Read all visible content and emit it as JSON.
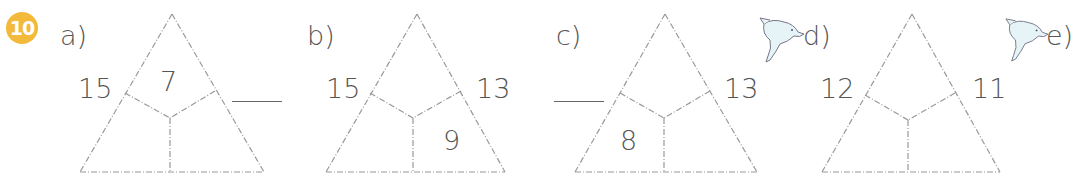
{
  "exercise": {
    "number": "10",
    "badge_color": "#f3b93b"
  },
  "problems": [
    {
      "label": "a)",
      "left": "15",
      "right": "",
      "top_inner": "7",
      "bl_inner": "",
      "br_inner": ""
    },
    {
      "label": "b)",
      "left": "15",
      "right": "13",
      "top_inner": "",
      "bl_inner": "",
      "br_inner": "9"
    },
    {
      "label": "c)",
      "left": "",
      "right": "13",
      "top_inner": "",
      "bl_inner": "8",
      "br_inner": ""
    },
    {
      "label": "d)",
      "left": "12",
      "right": "11",
      "top_inner": "",
      "bl_inner": "",
      "br_inner": ""
    },
    {
      "label": "e)"
    }
  ],
  "icons": [
    "dolphin-icon",
    "dolphin-icon"
  ]
}
